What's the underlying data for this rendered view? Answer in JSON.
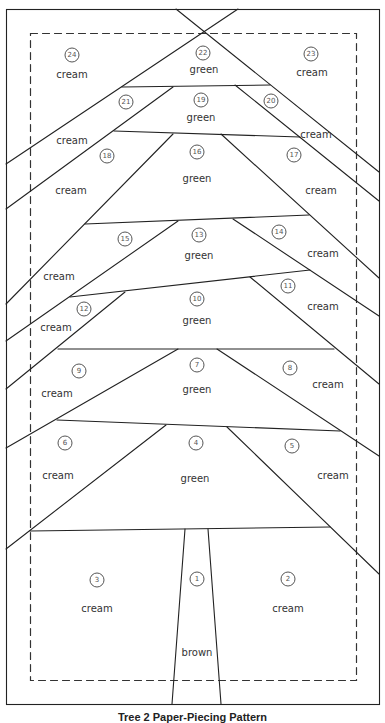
{
  "caption": "Tree 2 Paper-Piecing Pattern",
  "pieces": [
    {
      "num": "1",
      "color": "brown",
      "nx": 197,
      "ny": 579,
      "lx": 197,
      "ly": 653
    },
    {
      "num": "2",
      "color": "cream",
      "nx": 288,
      "ny": 579,
      "lx": 288,
      "ly": 609
    },
    {
      "num": "3",
      "color": "cream",
      "nx": 97,
      "ny": 580,
      "lx": 97,
      "ly": 609
    },
    {
      "num": "4",
      "color": "green",
      "nx": 196,
      "ny": 443,
      "lx": 195,
      "ly": 479
    },
    {
      "num": "5",
      "color": "cream",
      "nx": 292,
      "ny": 446,
      "lx": 333,
      "ly": 476
    },
    {
      "num": "6",
      "color": "cream",
      "nx": 65,
      "ny": 443,
      "lx": 58,
      "ly": 476
    },
    {
      "num": "7",
      "color": "green",
      "nx": 197,
      "ny": 365,
      "lx": 197,
      "ly": 390
    },
    {
      "num": "8",
      "color": "cream",
      "nx": 290,
      "ny": 368,
      "lx": 328,
      "ly": 385
    },
    {
      "num": "9",
      "color": "cream",
      "nx": 79,
      "ny": 371,
      "lx": 57,
      "ly": 394
    },
    {
      "num": "10",
      "color": "green",
      "nx": 197,
      "ny": 299,
      "lx": 197,
      "ly": 321
    },
    {
      "num": "11",
      "color": "cream",
      "nx": 288,
      "ny": 286,
      "lx": 323,
      "ly": 307
    },
    {
      "num": "12",
      "color": "cream",
      "nx": 84,
      "ny": 309,
      "lx": 56,
      "ly": 328
    },
    {
      "num": "13",
      "color": "green",
      "nx": 199,
      "ny": 235,
      "lx": 199,
      "ly": 256
    },
    {
      "num": "14",
      "color": "cream",
      "nx": 279,
      "ny": 232,
      "lx": 323,
      "ly": 254
    },
    {
      "num": "15",
      "color": "cream",
      "nx": 125,
      "ny": 239,
      "lx": 59,
      "ly": 277
    },
    {
      "num": "16",
      "color": "green",
      "nx": 197,
      "ny": 152,
      "lx": 197,
      "ly": 179
    },
    {
      "num": "17",
      "color": "cream",
      "nx": 294,
      "ny": 155,
      "lx": 321,
      "ly": 191
    },
    {
      "num": "18",
      "color": "cream",
      "nx": 107,
      "ny": 156,
      "lx": 71,
      "ly": 191
    },
    {
      "num": "19",
      "color": "green",
      "nx": 201,
      "ny": 100,
      "lx": 201,
      "ly": 118
    },
    {
      "num": "20",
      "color": "cream",
      "nx": 271,
      "ny": 101,
      "lx": 316,
      "ly": 135
    },
    {
      "num": "21",
      "color": "cream",
      "nx": 126,
      "ny": 102,
      "lx": 72,
      "ly": 141
    },
    {
      "num": "22",
      "color": "green",
      "nx": 203,
      "ny": 53,
      "lx": 204,
      "ly": 70
    },
    {
      "num": "23",
      "color": "cream",
      "nx": 311,
      "ny": 54,
      "lx": 312,
      "ly": 73
    },
    {
      "num": "24",
      "color": "cream",
      "nx": 72,
      "ny": 55,
      "lx": 72,
      "ly": 75
    }
  ]
}
